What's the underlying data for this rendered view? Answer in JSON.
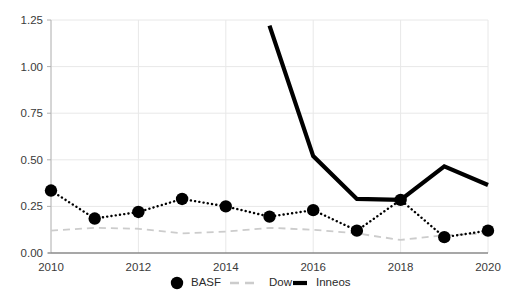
{
  "chart_data": {
    "type": "line",
    "title": "",
    "xlabel": "",
    "ylabel": "",
    "x": [
      2010,
      2011,
      2012,
      2013,
      2014,
      2015,
      2016,
      2017,
      2018,
      2019,
      2020
    ],
    "xlim": [
      2010,
      2020
    ],
    "ylim": [
      0.0,
      1.25
    ],
    "grid": true,
    "legend_position": "bottom-center",
    "xticks": [
      "2010",
      "2012",
      "2014",
      "2016",
      "2018",
      "2020"
    ],
    "xtick_values": [
      2010,
      2012,
      2014,
      2016,
      2018,
      2020
    ],
    "yticks": [
      "0.00",
      "0.25",
      "0.50",
      "0.75",
      "1.00",
      "1.25"
    ],
    "ytick_values": [
      0.0,
      0.25,
      0.5,
      0.75,
      1.0,
      1.25
    ],
    "series": [
      {
        "name": "BASF",
        "style": "dotted-markers",
        "color": "#000000",
        "marker": "circle",
        "x": [
          2010,
          2011,
          2012,
          2013,
          2014,
          2015,
          2016,
          2017,
          2018,
          2019,
          2020
        ],
        "values": [
          0.335,
          0.185,
          0.22,
          0.29,
          0.25,
          0.195,
          0.23,
          0.12,
          0.285,
          0.085,
          0.12
        ]
      },
      {
        "name": "Dow",
        "style": "dashed",
        "color": "#cccccc",
        "marker": "none",
        "x": [
          2010,
          2011,
          2012,
          2013,
          2014,
          2015,
          2016,
          2017,
          2018,
          2019,
          2020
        ],
        "values": [
          0.12,
          0.135,
          0.13,
          0.105,
          0.115,
          0.135,
          0.125,
          0.105,
          0.07,
          0.095,
          0.105
        ]
      },
      {
        "name": "Inneos",
        "style": "solid-thick",
        "color": "#000000",
        "marker": "none",
        "x": [
          2015,
          2016,
          2017,
          2018,
          2019,
          2020
        ],
        "values": [
          1.22,
          0.52,
          0.29,
          0.285,
          0.465,
          0.365
        ]
      }
    ]
  },
  "legend": {
    "items": [
      {
        "label": "BASF",
        "marker": "filled-circle",
        "color": "#000000"
      },
      {
        "label": "Dow",
        "marker": "dashed-line",
        "color": "#cccccc"
      },
      {
        "label": "Inneos",
        "marker": "solid-thick-line",
        "color": "#000000"
      }
    ]
  }
}
